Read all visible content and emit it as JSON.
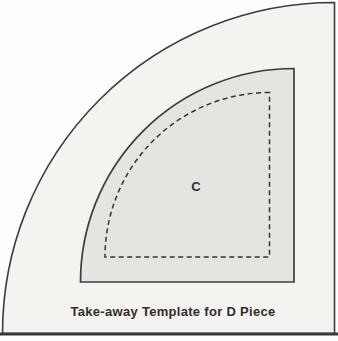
{
  "figure": {
    "caption": "Take-away Template for D Piece",
    "piece_label": "C"
  },
  "colors": {
    "page_background": "#fdfdfc",
    "outer_piece_fill": "#f4f3f0",
    "inner_piece_fill": "#e4e4e1",
    "outline_stroke": "#3c3c3c",
    "dashed_seam_stroke": "#333333",
    "text_color": "#2e2e2e"
  }
}
